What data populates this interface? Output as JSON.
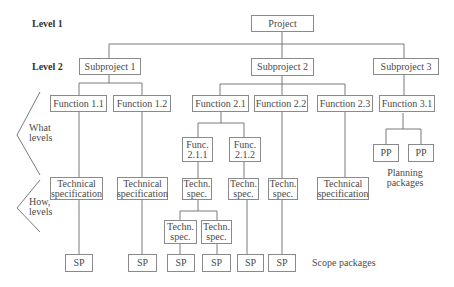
{
  "levels": {
    "level1": "Level 1",
    "level2": "Level 2"
  },
  "side_labels": {
    "what": "What\nlevels",
    "how": "How,\nlevels"
  },
  "nodes": {
    "project": "Project",
    "subproject1": "Subproject 1",
    "subproject2": "Subproject 2",
    "subproject3": "Subproject 3",
    "function_1_1": "Function 1.1",
    "function_1_2": "Function 1.2",
    "function_2_1": "Function 2.1",
    "function_2_2": "Function 2.2",
    "function_2_3": "Function 2.3",
    "function_3_1": "Function 3.1",
    "func_2_1_1": "Func.\n2.1.1",
    "func_2_1_2": "Func.\n2.1.2",
    "pp1": "PP",
    "pp2": "PP",
    "tech_spec_1_1": "Technical\nspecification",
    "tech_spec_1_2": "Technical\nspecification",
    "techn_spec_2_1_1": "Techn.\nspec.",
    "techn_spec_2_1_2": "Techn.\nspec.",
    "techn_spec_2_2": "Techn.\nspec.",
    "tech_spec_2_3": "Technical\nspecification",
    "techn_spec_sub_a": "Techn.\nspec.",
    "techn_spec_sub_b": "Techn.\nspec.",
    "sp1": "SP",
    "sp2": "SP",
    "sp3": "SP",
    "sp4": "SP",
    "sp5": "SP",
    "sp6": "SP"
  },
  "annotations": {
    "scope_packages": "Scope packages",
    "planning_packages": "Planning\npackages"
  },
  "colors": {
    "line": "#7a7a7a",
    "border": "#8a8a8a",
    "text": "#4a4a4a"
  }
}
